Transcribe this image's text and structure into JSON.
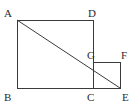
{
  "figure": {
    "background_color": "#ffffff",
    "stroke_color": "#3a3a3a",
    "label_color": "#2b2b2b",
    "stroke_width": 1,
    "width": 140,
    "height": 110,
    "vertices": [
      {
        "name": "A",
        "label": "A",
        "x": 17,
        "y": 20,
        "label_x": 4,
        "label_y": 8
      },
      {
        "name": "D",
        "label": "D",
        "x": 93,
        "y": 20,
        "label_x": 88,
        "label_y": 8
      },
      {
        "name": "B",
        "label": "B",
        "x": 17,
        "y": 88,
        "label_x": 4,
        "label_y": 92
      },
      {
        "name": "C",
        "label": "C",
        "x": 93,
        "y": 88,
        "label_x": 87,
        "label_y": 92
      },
      {
        "name": "G",
        "label": "G",
        "x": 93,
        "y": 62,
        "label_x": 87,
        "label_y": 50
      },
      {
        "name": "F",
        "label": "F",
        "x": 120,
        "y": 62,
        "label_x": 121,
        "label_y": 50
      },
      {
        "name": "E",
        "label": "E",
        "x": 120,
        "y": 88,
        "label_x": 122,
        "label_y": 92
      }
    ],
    "shapes": [
      {
        "name": "large-square-abcd",
        "type": "polygon",
        "points": "17,20 93,20 93,88 17,88"
      },
      {
        "name": "small-square-gfec",
        "type": "polygon",
        "points": "93,62 120,62 120,88 93,88"
      }
    ],
    "segments": [
      {
        "name": "diagonal-a-to-e",
        "x1": 17,
        "y1": 20,
        "x2": 120,
        "y2": 88
      }
    ]
  }
}
